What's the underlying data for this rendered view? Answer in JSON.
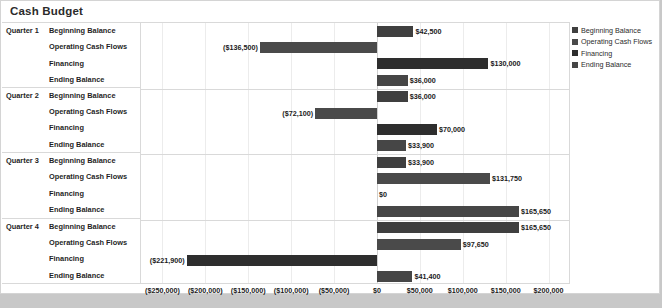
{
  "chart_data": {
    "type": "bar",
    "orientation": "horizontal",
    "title": "Cash Budget",
    "xlabel": "",
    "ylabel": "",
    "xlim": [
      -275000,
      225000
    ],
    "grid": true,
    "legend_position": "right",
    "legend": [
      "Beginning Balance",
      "Operating Cash Flows",
      "Financing",
      "Ending Balance"
    ],
    "tick_labels": [
      "($250,000)",
      "($200,000)",
      "($150,000)",
      "($100,000)",
      "($50,000)",
      "$0",
      "$50,000",
      "$100,000",
      "$150,000",
      "$200,000"
    ],
    "tick_values": [
      -250000,
      -200000,
      -150000,
      -100000,
      -50000,
      0,
      50000,
      100000,
      150000,
      200000
    ],
    "groups": [
      {
        "name": "Quarter 1",
        "rows": [
          {
            "category": "Beginning Balance",
            "value": 42500,
            "label": "$42,500",
            "series": 0
          },
          {
            "category": "Operating Cash Flows",
            "value": -136500,
            "label": "($136,500)",
            "series": 1
          },
          {
            "category": "Financing",
            "value": 130000,
            "label": "$130,000",
            "series": 2
          },
          {
            "category": "Ending Balance",
            "value": 36000,
            "label": "$36,000",
            "series": 3
          }
        ]
      },
      {
        "name": "Quarter 2",
        "rows": [
          {
            "category": "Beginning Balance",
            "value": 36000,
            "label": "$36,000",
            "series": 0
          },
          {
            "category": "Operating Cash Flows",
            "value": -72100,
            "label": "($72,100)",
            "series": 1
          },
          {
            "category": "Financing",
            "value": 70000,
            "label": "$70,000",
            "series": 2
          },
          {
            "category": "Ending Balance",
            "value": 33900,
            "label": "$33,900",
            "series": 3
          }
        ]
      },
      {
        "name": "Quarter 3",
        "rows": [
          {
            "category": "Beginning Balance",
            "value": 33900,
            "label": "$33,900",
            "series": 0
          },
          {
            "category": "Operating Cash Flows",
            "value": 131750,
            "label": "$131,750",
            "series": 1
          },
          {
            "category": "Financing",
            "value": 0,
            "label": "$0",
            "series": 2
          },
          {
            "category": "Ending Balance",
            "value": 165650,
            "label": "$165,650",
            "series": 3
          }
        ]
      },
      {
        "name": "Quarter 4",
        "rows": [
          {
            "category": "Beginning Balance",
            "value": 165650,
            "label": "$165,650",
            "series": 0
          },
          {
            "category": "Operating Cash Flows",
            "value": 97650,
            "label": "$97,650",
            "series": 1
          },
          {
            "category": "Financing",
            "value": -221900,
            "label": "($221,900)",
            "series": 2
          },
          {
            "category": "Ending Balance",
            "value": 41400,
            "label": "$41,400",
            "series": 3
          }
        ]
      }
    ]
  },
  "colors": {
    "series_0": "#3f3f3f",
    "series_1": "#4a4a4a",
    "series_2": "#2e2e2e",
    "series_3": "#464646",
    "plot_border": "#d9d9d9",
    "gridline": "#ececec",
    "background": "#ffffff",
    "page_background": "#c8c8c8",
    "text": "#1f1f1f"
  }
}
